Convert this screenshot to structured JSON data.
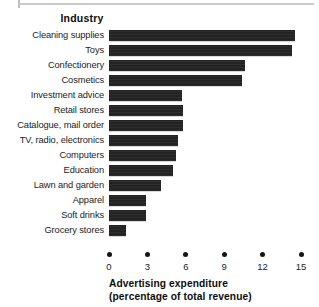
{
  "figure": {
    "column_title": "Industry",
    "clipped_top_text": "",
    "caption_line1": "Advertising expenditure",
    "caption_line2": "(percentage of total revenue)",
    "bar_color": "#232323",
    "text_color": "#1c1c1c"
  },
  "chart_data": {
    "type": "bar",
    "orientation": "horizontal",
    "title": "Industry",
    "xlabel": "Advertising expenditure (percentage of total revenue)",
    "ylabel": "Industry",
    "xlim": [
      0,
      15
    ],
    "xticks": [
      0,
      3,
      6,
      9,
      12,
      15
    ],
    "xtick_labels": [
      "0",
      "3",
      "6",
      "9",
      "12",
      "15"
    ],
    "grid": false,
    "legend": null,
    "categories": [
      "Cleaning supplies",
      "Toys",
      "Confectionery",
      "Cosmetics",
      "Investment advice",
      "Retail stores",
      "Catalogue, mail order",
      "TV, radio, electronics",
      "Computers",
      "Education",
      "Lawn and garden",
      "Apparel",
      "Soft drinks",
      "Grocery stores"
    ],
    "values": [
      14.5,
      14.3,
      10.6,
      10.4,
      5.7,
      5.8,
      5.8,
      5.4,
      5.2,
      5.0,
      4.1,
      2.9,
      2.9,
      1.3
    ]
  }
}
